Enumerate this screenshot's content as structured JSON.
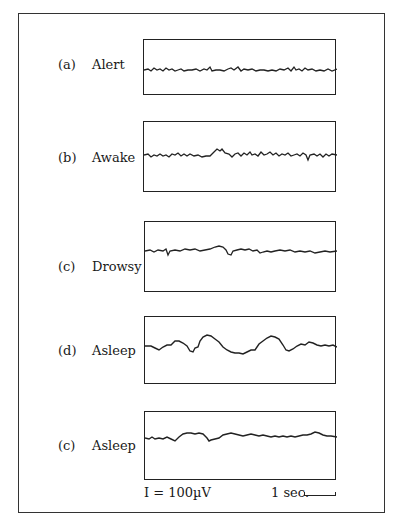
{
  "figure": {
    "rows": [
      {
        "tag": "(a)",
        "label": "Alert"
      },
      {
        "tag": "(b)",
        "label": "Awake"
      },
      {
        "tag": "(c)",
        "label": "Drowsy"
      },
      {
        "tag": "(d)",
        "label": "Asleep"
      },
      {
        "tag": "(c)",
        "label": "Asleep"
      }
    ],
    "amplitude_scale": "I = 100µV",
    "time_scale": "1 sec."
  }
}
